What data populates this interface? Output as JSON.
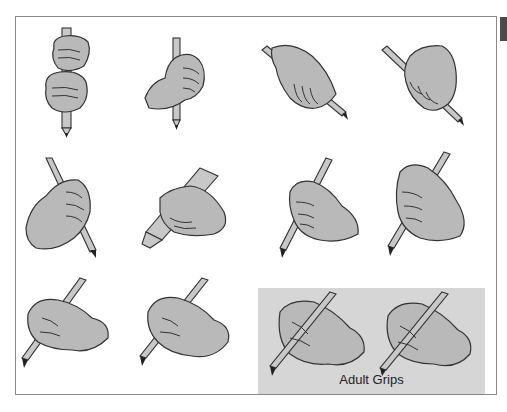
{
  "figure": {
    "type": "illustration",
    "grips": [
      {
        "id": 1,
        "row": 1,
        "col": 1,
        "description": "two-fisted palmar grip, vertical pencil"
      },
      {
        "id": 2,
        "row": 1,
        "col": 2,
        "description": "fisted grip, vertical pencil"
      },
      {
        "id": 3,
        "row": 1,
        "col": 3,
        "description": "palmar supinate grip, diagonal pencil"
      },
      {
        "id": 4,
        "row": 1,
        "col": 4,
        "description": "digital pronate grip, diagonal pencil"
      },
      {
        "id": 5,
        "row": 2,
        "col": 1,
        "description": "fisted grip, pencil pointing down-right"
      },
      {
        "id": 6,
        "row": 2,
        "col": 2,
        "description": "grip on thick marker"
      },
      {
        "id": 7,
        "row": 2,
        "col": 3,
        "description": "pronated grip, pencil pointing down-left"
      },
      {
        "id": 8,
        "row": 2,
        "col": 4,
        "description": "pronated grip, pencil pointing down-left"
      },
      {
        "id": 9,
        "row": 3,
        "col": 1,
        "description": "tripod-like writing grip"
      },
      {
        "id": 10,
        "row": 3,
        "col": 2,
        "description": "tripod-like writing grip"
      }
    ],
    "adult_panel": {
      "label": "Adult Grips",
      "grips": [
        {
          "id": 11,
          "description": "dynamic tripod grip"
        },
        {
          "id": 12,
          "description": "lateral tripod grip"
        }
      ]
    }
  }
}
